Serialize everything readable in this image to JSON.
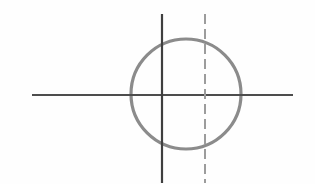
{
  "canvas": {
    "width": 315,
    "height": 184,
    "background_color": "#fefefe",
    "title": "Geometric figure: circle with vertical axis, dashed vertical line and horizontal axis"
  },
  "chart_data": {
    "type": "scatter",
    "title": "",
    "subtitle": "",
    "xlabel": "",
    "ylabel": "",
    "grid": false,
    "legend": "none",
    "xlim": [
      0,
      315
    ],
    "ylim": [
      0,
      184
    ],
    "annotations": [],
    "shapes": [
      {
        "name": "circle",
        "kind": "circle",
        "cx": 186,
        "cy": 94,
        "r": 55,
        "stroke_color": "#8b8b8b",
        "stroke_width": 3.2,
        "dash": "none",
        "fill": "none"
      },
      {
        "name": "horizontal-axis-line",
        "kind": "line",
        "x1": 32,
        "y1": 95,
        "x2": 293,
        "y2": 95,
        "stroke_color": "#4d4d4d",
        "stroke_width": 2.0,
        "dash": "none"
      },
      {
        "name": "solid-vertical-line",
        "kind": "line",
        "x1": 162,
        "y1": 14,
        "x2": 162,
        "y2": 183,
        "stroke_color": "#3f3f3f",
        "stroke_width": 2.2,
        "dash": "none"
      },
      {
        "name": "dashed-vertical-line",
        "kind": "line",
        "x1": 205,
        "y1": 14,
        "x2": 205,
        "y2": 183,
        "stroke_color": "#9c9c9c",
        "stroke_width": 2.0,
        "dash": "10 5"
      }
    ],
    "intersections": [
      {
        "name": "center-intersection",
        "x": 162,
        "y": 95
      },
      {
        "name": "dashed-horizontal-intersection",
        "x": 205,
        "y": 95
      },
      {
        "name": "circle-left-horizontal",
        "x": 131,
        "y": 95
      },
      {
        "name": "circle-right-horizontal",
        "x": 241,
        "y": 95
      }
    ]
  },
  "colors": {
    "circle_stroke": "#8b8b8b",
    "solid_line": "#3f3f3f",
    "dashed_line": "#9c9c9c",
    "horizontal_line": "#4d4d4d",
    "background": "#fefefe"
  }
}
